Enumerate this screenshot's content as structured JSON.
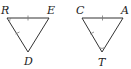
{
  "figure": {
    "triangles": [
      {
        "name": "triangle-RED",
        "vertices": [
          {
            "label": "R"
          },
          {
            "label": "E"
          },
          {
            "label": "D"
          }
        ],
        "congruence_marks": {
          "single_tick_sides": [
            "RE",
            "RD"
          ],
          "angle_arc": "R"
        }
      },
      {
        "name": "triangle-CAT",
        "vertices": [
          {
            "label": "C"
          },
          {
            "label": "A"
          },
          {
            "label": "T"
          }
        ],
        "congruence_marks": {
          "single_tick_sides": [
            "CA",
            "CT"
          ],
          "angle_arc": "T"
        }
      }
    ]
  }
}
